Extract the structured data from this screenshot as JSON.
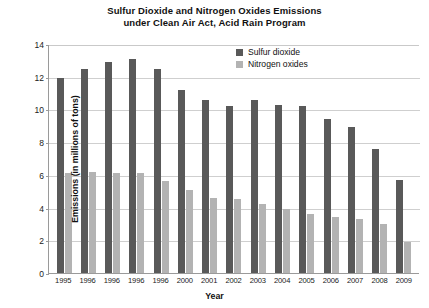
{
  "chart_data": {
    "type": "bar",
    "title": "Sulfur Dioxide and Nitrogen Oxides Emissions under Clean Air Act, Acid Rain Program",
    "title_line1": "Sulfur Dioxide and Nitrogen Oxides Emissions",
    "title_line2": "under Clean Air Act, Acid Rain Program",
    "xlabel": "Year",
    "ylabel": "Emissions (in millions of tons)",
    "categories": [
      "1995",
      "1996",
      "1996",
      "1996",
      "1996",
      "2000",
      "2001",
      "2002",
      "2003",
      "2004",
      "2005",
      "2006",
      "2007",
      "2008",
      "2009"
    ],
    "series": [
      {
        "name": "Sulfur dioxide",
        "color": "#595959",
        "values": [
          11.9,
          12.5,
          12.9,
          13.1,
          12.5,
          11.2,
          10.6,
          10.2,
          10.6,
          10.3,
          10.2,
          9.4,
          8.9,
          7.6,
          5.7
        ]
      },
      {
        "name": "Nitrogen oxides",
        "color": "#b3b3b3",
        "values": [
          6.1,
          6.2,
          6.1,
          6.1,
          5.6,
          5.1,
          4.6,
          4.5,
          4.2,
          3.9,
          3.6,
          3.4,
          3.3,
          3.0,
          1.9
        ]
      }
    ],
    "ylim": [
      0,
      14
    ],
    "yticks": [
      0,
      2,
      4,
      6,
      8,
      10,
      12,
      14
    ],
    "grid": true,
    "legend_position": "top-right"
  }
}
